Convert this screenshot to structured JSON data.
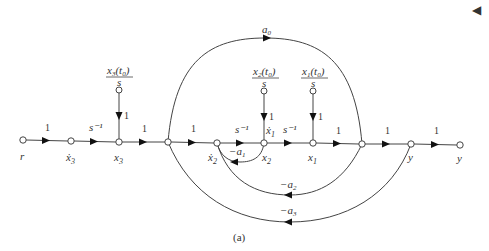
{
  "caption": "(a)",
  "corner_marker": "◀",
  "nodes": [
    {
      "id": "r",
      "label": "r"
    },
    {
      "id": "x3dot",
      "label": "ẋ",
      "sub": "3"
    },
    {
      "id": "x3",
      "label": "x",
      "sub": "3"
    },
    {
      "id": "n4",
      "label": ""
    },
    {
      "id": "x2dot",
      "label": "ẋ",
      "sub": "2"
    },
    {
      "id": "x2",
      "label": "x",
      "sub": "2",
      "label_above": "ẋ",
      "sub_above": "1"
    },
    {
      "id": "x1",
      "label": "x",
      "sub": "1"
    },
    {
      "id": "n8",
      "label": ""
    },
    {
      "id": "y",
      "label": "y"
    },
    {
      "id": "y_out",
      "label": "y"
    }
  ],
  "forward_gains": [
    "1",
    "s⁻¹",
    "1",
    "1",
    "s⁻¹",
    "s⁻¹",
    "1",
    "1",
    "1"
  ],
  "initial_conditions": [
    {
      "num": "x",
      "sub": "3",
      "arg": "(t",
      "arg_sub": "0",
      "close": ")",
      "den": "s",
      "gain": "1"
    },
    {
      "num": "x",
      "sub": "2",
      "arg": "(t",
      "arg_sub": "0",
      "close": ")",
      "den": "s",
      "gain": "1"
    },
    {
      "num": "x",
      "sub": "1",
      "arg": "(t",
      "arg_sub": "0",
      "close": ")",
      "den": "s",
      "gain": "1"
    }
  ],
  "feedforward": {
    "label": "a",
    "sub": "0"
  },
  "feedback": [
    {
      "label": "−a",
      "sub": "1"
    },
    {
      "label": "−a",
      "sub": "2"
    },
    {
      "label": "−a",
      "sub": "3"
    }
  ]
}
